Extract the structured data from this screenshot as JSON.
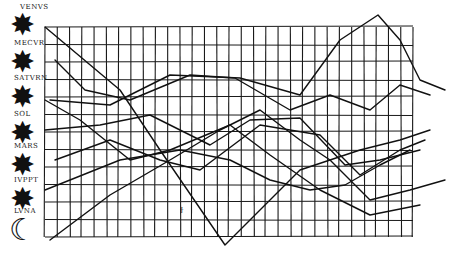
{
  "colors": {
    "ink": "#111111",
    "paper": "#ffffff",
    "grid": "#1a1a1a"
  },
  "planets": [
    {
      "label": "VENVS",
      "icon": "star-icon"
    },
    {
      "label": "MECVR",
      "icon": "star-icon"
    },
    {
      "label": "SATVRN",
      "icon": "star-icon"
    },
    {
      "label": "SOL",
      "icon": "star-icon"
    },
    {
      "label": "MARS",
      "icon": "star-icon"
    },
    {
      "label": "IVPPT",
      "icon": "star-icon"
    },
    {
      "label": "LVNA",
      "icon": "moon-icon"
    }
  ],
  "grid": {
    "columns": 30,
    "rows": 12
  },
  "annotation": "ϯ",
  "glyphs": {
    "star": "✸",
    "moon": "☾"
  }
}
